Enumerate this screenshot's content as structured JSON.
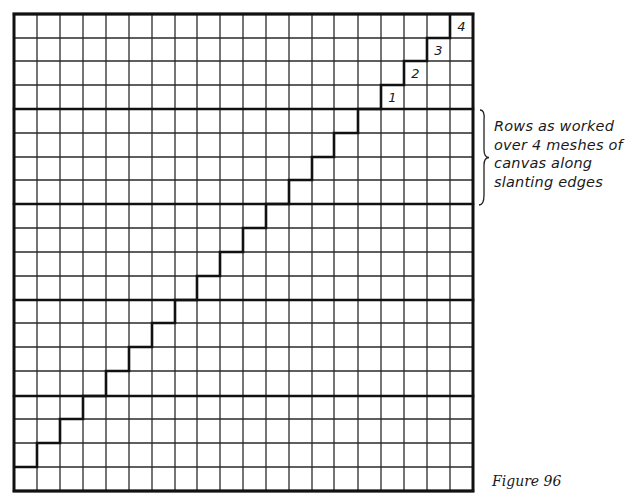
{
  "figure": {
    "caption": "Figure 96",
    "annotation": {
      "lines": [
        "Rows as worked",
        "over 4 meshes of",
        "canvas along",
        "slanting edges"
      ]
    }
  },
  "grid": {
    "columns": 20,
    "rows": 20,
    "rows_per_band": 4,
    "x_lines": [
      14,
      37,
      60,
      83,
      106,
      129,
      152,
      175,
      197,
      220,
      243,
      266,
      289,
      312,
      334,
      358,
      381,
      404,
      427,
      450,
      473
    ],
    "y_lines": [
      14,
      38,
      61,
      85,
      109,
      133,
      157,
      180,
      204,
      228,
      252,
      276,
      300,
      323,
      347,
      371,
      396,
      419,
      443,
      467,
      491
    ],
    "thick_row_lines": [
      0,
      4,
      8,
      12,
      16,
      20
    ],
    "line_color": "#2a2a2a",
    "thick_color": "#111111"
  },
  "staircase": {
    "description": "Stepped edge rising one mesh per row across 5 bands of 4 rows",
    "points": [
      [
        0,
        19
      ],
      [
        1,
        19
      ],
      [
        1,
        18
      ],
      [
        2,
        18
      ],
      [
        2,
        17
      ],
      [
        3,
        17
      ],
      [
        3,
        16
      ],
      [
        4,
        16
      ],
      [
        4,
        15
      ],
      [
        5,
        15
      ],
      [
        5,
        14
      ],
      [
        6,
        14
      ],
      [
        6,
        13
      ],
      [
        7,
        13
      ],
      [
        7,
        12
      ],
      [
        8,
        12
      ],
      [
        8,
        11
      ],
      [
        9,
        11
      ],
      [
        9,
        10
      ],
      [
        10,
        10
      ],
      [
        10,
        9
      ],
      [
        11,
        9
      ],
      [
        11,
        8
      ],
      [
        12,
        8
      ],
      [
        12,
        7
      ],
      [
        13,
        7
      ],
      [
        13,
        6
      ],
      [
        14,
        6
      ],
      [
        14,
        5
      ],
      [
        15,
        5
      ],
      [
        15,
        4
      ],
      [
        16,
        4
      ],
      [
        16,
        3
      ],
      [
        17,
        3
      ],
      [
        17,
        2
      ],
      [
        18,
        2
      ],
      [
        18,
        1
      ],
      [
        19,
        1
      ],
      [
        19,
        0
      ]
    ],
    "band_connectors": [
      {
        "col": 3,
        "from_row": 16,
        "to_row": 17
      },
      {
        "col": 4,
        "from_row": 16,
        "to_row": 15
      }
    ]
  },
  "step_labels": [
    {
      "text": "1",
      "col": 16,
      "row": 3
    },
    {
      "text": "2",
      "col": 17,
      "row": 2
    },
    {
      "text": "3",
      "col": 18,
      "row": 1
    },
    {
      "text": "4",
      "col": 19,
      "row": 0
    }
  ],
  "bracket": {
    "x": 482,
    "y_top": 110,
    "y_bottom": 205,
    "tip_x": 488
  }
}
